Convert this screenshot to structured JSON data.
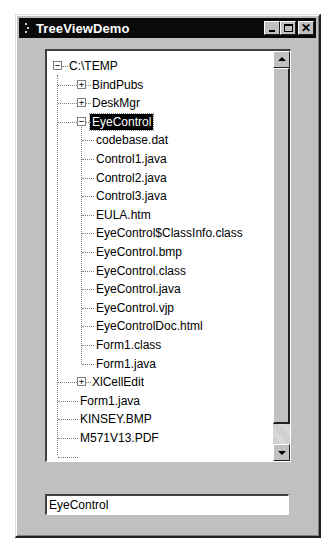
{
  "window": {
    "title": "TreeViewDemo",
    "buttons": {
      "minimize": "_",
      "maximize": "□",
      "close": "✕"
    }
  },
  "tree": {
    "root": {
      "label": "C:\\TEMP",
      "expanded": true
    },
    "items": [
      {
        "label": "BindPubs",
        "level": 1,
        "type": "folder",
        "expanded": false
      },
      {
        "label": "DeskMgr",
        "level": 1,
        "type": "folder",
        "expanded": false
      },
      {
        "label": "EyeControl",
        "level": 1,
        "type": "folder",
        "expanded": true,
        "selected": true
      },
      {
        "label": "codebase.dat",
        "level": 2,
        "type": "file"
      },
      {
        "label": "Control1.java",
        "level": 2,
        "type": "file"
      },
      {
        "label": "Control2.java",
        "level": 2,
        "type": "file"
      },
      {
        "label": "Control3.java",
        "level": 2,
        "type": "file"
      },
      {
        "label": "EULA.htm",
        "level": 2,
        "type": "file"
      },
      {
        "label": "EyeControl$ClassInfo.class",
        "level": 2,
        "type": "file"
      },
      {
        "label": "EyeControl.bmp",
        "level": 2,
        "type": "file"
      },
      {
        "label": "EyeControl.class",
        "level": 2,
        "type": "file"
      },
      {
        "label": "EyeControl.java",
        "level": 2,
        "type": "file"
      },
      {
        "label": "EyeControl.vjp",
        "level": 2,
        "type": "file"
      },
      {
        "label": "EyeControlDoc.html",
        "level": 2,
        "type": "file"
      },
      {
        "label": "Form1.class",
        "level": 2,
        "type": "file"
      },
      {
        "label": "Form1.java",
        "level": 2,
        "type": "file"
      },
      {
        "label": "XlCellEdit",
        "level": 1,
        "type": "folder",
        "expanded": false
      },
      {
        "label": "Form1.java",
        "level": 1,
        "type": "file"
      },
      {
        "label": "KINSEY.BMP",
        "level": 1,
        "type": "file"
      },
      {
        "label": "M571V13.PDF",
        "level": 1,
        "type": "file"
      },
      {
        "label": "...",
        "level": 1,
        "type": "file",
        "partial": true
      }
    ]
  },
  "selection_field": {
    "value": "EyeControl"
  },
  "colors": {
    "face": "#c0c0c0",
    "titlebar": "#0a0a0a",
    "selection": "#000000"
  }
}
